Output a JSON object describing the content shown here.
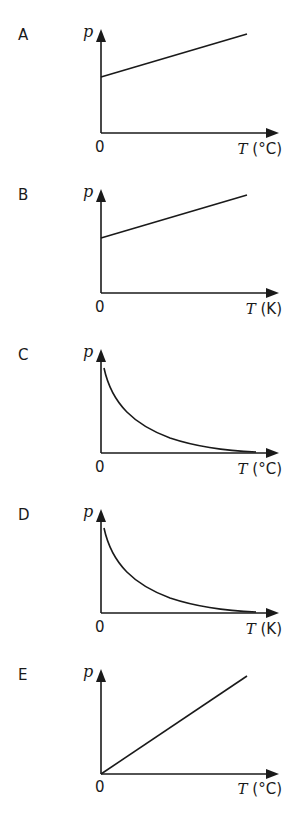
{
  "options": [
    {
      "label": "A",
      "y_axis": "p",
      "origin": "0",
      "x_axis_symbol": "T",
      "x_axis_unit": "(°C)",
      "curve": "linear, positive intercept"
    },
    {
      "label": "B",
      "y_axis": "p",
      "origin": "0",
      "x_axis_symbol": "T",
      "x_axis_unit": "(K)",
      "curve": "linear, positive intercept"
    },
    {
      "label": "C",
      "y_axis": "p",
      "origin": "0",
      "x_axis_symbol": "T",
      "x_axis_unit": "(°C)",
      "curve": "inverse decay"
    },
    {
      "label": "D",
      "y_axis": "p",
      "origin": "0",
      "x_axis_symbol": "T",
      "x_axis_unit": "(K)",
      "curve": "inverse decay"
    },
    {
      "label": "E",
      "y_axis": "p",
      "origin": "0",
      "x_axis_symbol": "T",
      "x_axis_unit": "(°C)",
      "curve": "linear through origin"
    }
  ],
  "colors": {
    "ink": "#1a1a1a",
    "background": "#ffffff"
  }
}
